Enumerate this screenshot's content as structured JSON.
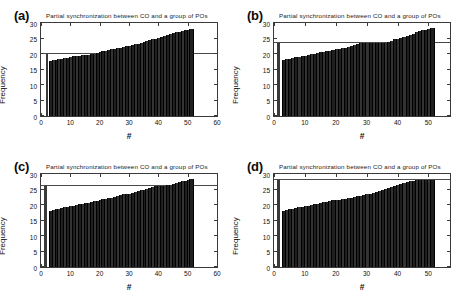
{
  "figure": {
    "width": 466,
    "height": 303,
    "background": "#ffffff",
    "panel_count": 4
  },
  "chart_data": [
    {
      "panel": "a",
      "label": "(a)",
      "type": "bar",
      "title": "Partial synchronization between CO and a group of POs",
      "xlabel": "#",
      "ylabel": "Frequency",
      "xlim": [
        0,
        60
      ],
      "ylim": [
        0,
        30
      ],
      "xticks": [
        0,
        10,
        20,
        30,
        40,
        50,
        60
      ],
      "yticks": [
        0,
        5,
        10,
        15,
        20,
        25,
        30
      ],
      "grid": false,
      "legend": "none",
      "reference_line_y": 20.0,
      "reference_bar": {
        "x": 2,
        "height": 20.0
      },
      "x": [
        3,
        4,
        5,
        6,
        7,
        8,
        9,
        10,
        11,
        12,
        13,
        14,
        15,
        16,
        17,
        18,
        19,
        20,
        21,
        22,
        23,
        24,
        25,
        26,
        27,
        28,
        29,
        30,
        31,
        32,
        33,
        34,
        35,
        36,
        37,
        38,
        39,
        40,
        41,
        42,
        43,
        44,
        45,
        46,
        47,
        48,
        49,
        50,
        51
      ],
      "values": [
        17.9,
        18.0,
        18.1,
        18.3,
        18.4,
        18.6,
        18.8,
        19.0,
        19.2,
        19.4,
        19.5,
        19.6,
        19.7,
        19.8,
        19.9,
        20.0,
        20.3,
        20.6,
        20.9,
        21.1,
        21.3,
        21.5,
        21.7,
        21.9,
        22.1,
        22.3,
        22.5,
        22.7,
        22.9,
        23.1,
        23.3,
        23.5,
        23.8,
        24.1,
        24.4,
        24.7,
        25.0,
        25.3,
        25.6,
        25.9,
        26.2,
        26.5,
        26.8,
        27.0,
        27.2,
        27.4,
        27.6,
        27.8,
        28.0
      ]
    },
    {
      "panel": "b",
      "label": "(b)",
      "type": "bar",
      "title": "Partial synchronization between CO and a group of POs",
      "xlabel": "#",
      "ylabel": "Frequency",
      "xlim": [
        0,
        57
      ],
      "ylim": [
        0,
        30
      ],
      "xticks": [
        0,
        10,
        20,
        30,
        40,
        50
      ],
      "yticks": [
        0,
        5,
        10,
        15,
        20,
        25,
        30
      ],
      "grid": false,
      "legend": "none",
      "reference_line_y": 23.7,
      "reference_bar": {
        "x": 1.5,
        "height": 23.7
      },
      "x": [
        3,
        4,
        5,
        6,
        7,
        8,
        9,
        10,
        11,
        12,
        13,
        14,
        15,
        16,
        17,
        18,
        19,
        20,
        21,
        22,
        23,
        24,
        25,
        26,
        27,
        28,
        29,
        30,
        31,
        32,
        33,
        34,
        35,
        36,
        37,
        38,
        39,
        40,
        41,
        42,
        43,
        44,
        45,
        46,
        47,
        48,
        49,
        50,
        51
      ],
      "values": [
        18.1,
        18.3,
        18.5,
        18.7,
        18.9,
        19.1,
        19.3,
        19.5,
        19.7,
        19.9,
        20.1,
        20.3,
        20.5,
        20.7,
        20.9,
        21.1,
        21.3,
        21.5,
        21.7,
        21.9,
        22.1,
        22.3,
        22.5,
        22.8,
        23.1,
        23.4,
        23.6,
        23.7,
        23.7,
        23.7,
        23.7,
        23.7,
        23.7,
        23.7,
        23.9,
        24.3,
        24.7,
        25.0,
        25.3,
        25.6,
        25.9,
        26.2,
        26.6,
        27.0,
        27.3,
        27.6,
        27.9,
        28.1,
        28.3
      ]
    },
    {
      "panel": "c",
      "label": "(c)",
      "type": "bar",
      "title": "Partial synchronization between CO and a group of POs",
      "xlabel": "#",
      "ylabel": "Frequency",
      "xlim": [
        0,
        60
      ],
      "ylim": [
        0,
        30
      ],
      "xticks": [
        0,
        10,
        20,
        30,
        40,
        50,
        60
      ],
      "yticks": [
        0,
        5,
        10,
        15,
        20,
        25,
        30
      ],
      "grid": false,
      "legend": "none",
      "reference_line_y": 26.0,
      "reference_bar": {
        "x": 1.5,
        "height": 26.0
      },
      "x": [
        3,
        4,
        5,
        6,
        7,
        8,
        9,
        10,
        11,
        12,
        13,
        14,
        15,
        16,
        17,
        18,
        19,
        20,
        21,
        22,
        23,
        24,
        25,
        26,
        27,
        28,
        29,
        30,
        31,
        32,
        33,
        34,
        35,
        36,
        37,
        38,
        39,
        40,
        41,
        42,
        43,
        44,
        45,
        46,
        47,
        48,
        49,
        50,
        51
      ],
      "values": [
        18.2,
        18.4,
        18.6,
        18.8,
        19.0,
        19.2,
        19.4,
        19.6,
        19.8,
        20.0,
        20.2,
        20.4,
        20.6,
        20.8,
        21.0,
        21.2,
        21.4,
        21.6,
        21.8,
        22.0,
        22.2,
        22.4,
        22.6,
        22.9,
        23.2,
        23.4,
        23.5,
        23.6,
        23.8,
        24.1,
        24.4,
        24.7,
        25.0,
        25.3,
        25.6,
        25.8,
        26.0,
        26.0,
        26.0,
        26.1,
        26.3,
        26.6,
        26.9,
        27.2,
        27.5,
        27.7,
        27.9,
        28.1,
        28.3
      ]
    },
    {
      "panel": "d",
      "label": "(d)",
      "type": "bar",
      "title": "Partial synchronization between CO and a group of POs",
      "xlabel": "#",
      "ylabel": "Frequency",
      "xlim": [
        0,
        57
      ],
      "ylim": [
        0,
        30
      ],
      "xticks": [
        0,
        10,
        20,
        30,
        40,
        50
      ],
      "yticks": [
        0,
        5,
        10,
        15,
        20,
        25,
        30
      ],
      "grid": false,
      "legend": "none",
      "reference_line_y": 28.0,
      "reference_bar": {
        "x": 1.5,
        "height": 28.0
      },
      "x": [
        3,
        4,
        5,
        6,
        7,
        8,
        9,
        10,
        11,
        12,
        13,
        14,
        15,
        16,
        17,
        18,
        19,
        20,
        21,
        22,
        23,
        24,
        25,
        26,
        27,
        28,
        29,
        30,
        31,
        32,
        33,
        34,
        35,
        36,
        37,
        38,
        39,
        40,
        41,
        42,
        43,
        44,
        45,
        46,
        47,
        48,
        49,
        50,
        51
      ],
      "values": [
        18.2,
        18.4,
        18.6,
        18.8,
        19.0,
        19.2,
        19.4,
        19.6,
        19.8,
        20.0,
        20.2,
        20.4,
        20.6,
        20.9,
        21.1,
        21.3,
        21.5,
        21.6,
        21.7,
        21.8,
        22.0,
        22.2,
        22.4,
        22.6,
        22.8,
        23.0,
        23.2,
        23.4,
        23.7,
        24.0,
        24.3,
        24.6,
        24.9,
        25.2,
        25.5,
        25.8,
        26.1,
        26.4,
        26.7,
        27.0,
        27.3,
        27.6,
        27.9,
        28.0,
        28.0,
        28.0,
        28.0,
        28.0,
        28.0
      ]
    }
  ]
}
